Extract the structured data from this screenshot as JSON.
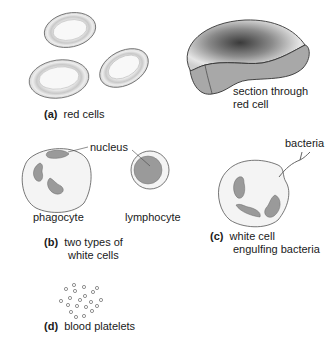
{
  "figure": {
    "panels": [
      {
        "id": "a",
        "tag": "(a)",
        "caption": "red cells"
      },
      {
        "id": "a2",
        "caption_line1": "section through",
        "caption_line2": "red cell"
      },
      {
        "id": "b",
        "tag": "(b)",
        "caption_line1": "two types of",
        "caption_line2": "white cells"
      },
      {
        "id": "c",
        "tag": "(c)",
        "caption_line1": "white cell",
        "caption_line2": "engulfing bacteria"
      },
      {
        "id": "d",
        "tag": "(d)",
        "caption": "blood platelets"
      }
    ],
    "labels": {
      "nucleus": "nucleus",
      "phagocyte": "phagocyte",
      "lymphocyte": "lymphocyte",
      "bacteria": "bacteria"
    },
    "colors": {
      "outline": "#555555",
      "cell_fill": "#f4f4f4",
      "nucleus_fill": "#9a9a9a",
      "section_fill": "#a8a8a8",
      "stipple": "#3a3a3a"
    }
  }
}
